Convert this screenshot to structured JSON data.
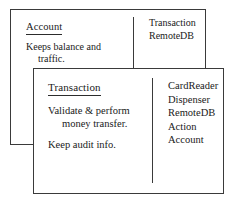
{
  "diagram": {
    "background_color": "#ffffff",
    "line_color": "#3a3a3a",
    "text_color": "#1a1a1a",
    "cards": [
      {
        "id": "account-card",
        "class_name": "Account",
        "responsibilities": [
          "Keeps balance and traffic."
        ],
        "collaborators": [
          "Transaction",
          "RemoteDB"
        ]
      },
      {
        "id": "transaction-card",
        "class_name": "Transaction",
        "responsibilities": [
          "Validate & perform money transfer.",
          "Keep audit info."
        ],
        "collaborators": [
          "CardReader",
          "Dispenser",
          "RemoteDB",
          "Action",
          "Account"
        ]
      }
    ]
  }
}
